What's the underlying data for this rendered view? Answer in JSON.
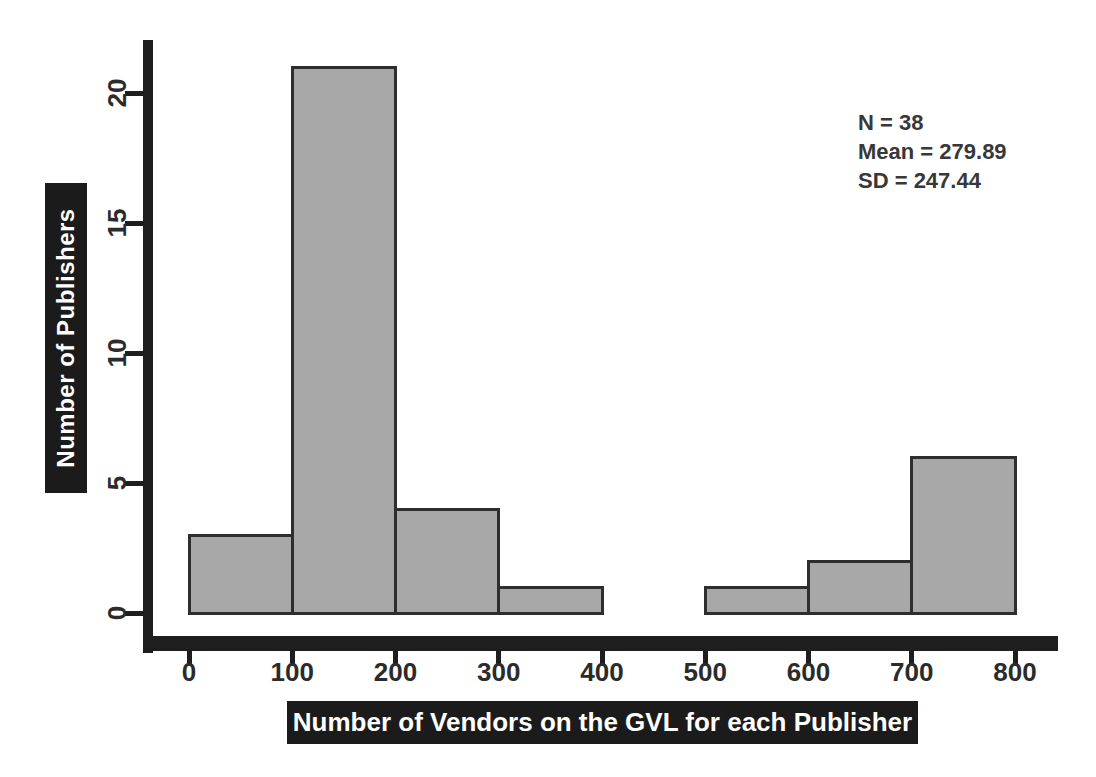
{
  "figure": {
    "background": "#ffffff"
  },
  "chart_data": {
    "type": "histogram",
    "xlabel": "Number of Vendors on the GVL for each Publisher",
    "ylabel": "Number of Publishers",
    "bin_edges": [
      0,
      100,
      200,
      300,
      400,
      500,
      600,
      700,
      800
    ],
    "counts": [
      3,
      21,
      4,
      1,
      0,
      1,
      2,
      6
    ],
    "xticks": [
      0,
      100,
      200,
      300,
      400,
      500,
      600,
      700,
      800
    ],
    "yticks": [
      0,
      5,
      10,
      15,
      20
    ],
    "xlim": [
      -45,
      840
    ],
    "ylim": [
      0,
      22
    ],
    "grid": false,
    "annotation": {
      "lines": [
        "N = 38",
        "Mean = 279.89",
        "SD = 247.44"
      ]
    },
    "colors": {
      "bar_fill": "#a8a8a8",
      "bar_border": "#2e2e2e",
      "axis": "#1e1e1e",
      "tick_label": "#2b2b2b",
      "axis_label_bg": "#1b1b1b",
      "axis_label_text": "#ffffff",
      "annotation_text": "#383838"
    }
  }
}
